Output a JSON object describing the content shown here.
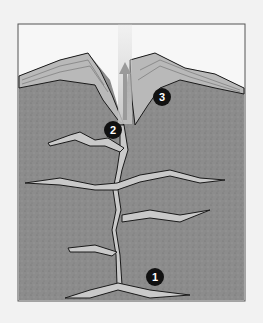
{
  "diagram": {
    "colors": {
      "background": "#f2f2f2",
      "sky": "#f7f7f7",
      "rock": "#8a8a8a",
      "strata": "#b5b5b5",
      "magma": "#c9c9c9",
      "outline": "#1a1a1a",
      "marker": "#111111"
    },
    "markers": [
      {
        "id": "1",
        "label": "1",
        "x": 155,
        "y": 277
      },
      {
        "id": "2",
        "label": "2",
        "x": 113,
        "y": 130
      },
      {
        "id": "3",
        "label": "3",
        "x": 162,
        "y": 97
      }
    ]
  }
}
